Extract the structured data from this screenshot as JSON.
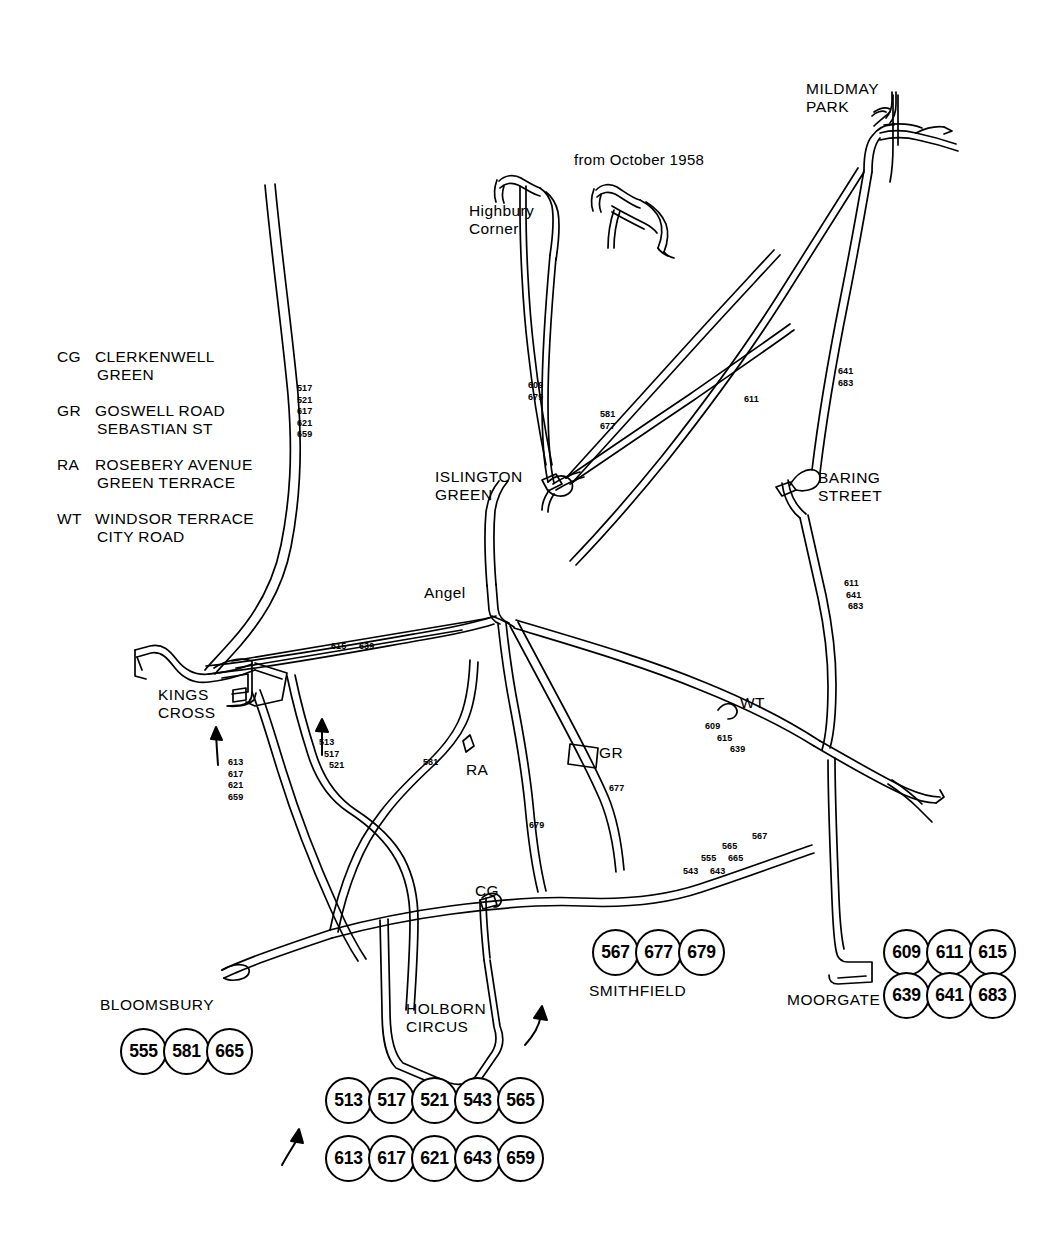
{
  "diagram": {
    "note": "from October 1958"
  },
  "legend": {
    "items": [
      {
        "code": "CG",
        "lines": [
          "CLERKENWELL",
          "GREEN"
        ]
      },
      {
        "code": "GR",
        "lines": [
          "GOSWELL ROAD",
          "SEBASTIAN ST"
        ]
      },
      {
        "code": "RA",
        "lines": [
          "ROSEBERY AVENUE",
          "GREEN TERRACE"
        ]
      },
      {
        "code": "WT",
        "lines": [
          "WINDSOR TERRACE",
          "CITY ROAD"
        ]
      }
    ]
  },
  "places": {
    "mildmay_park": "MILDMAY\nPARK",
    "mildmay_park_l1": "MILDMAY",
    "mildmay_park_l2": "PARK",
    "highbury_corner_l1": "Highbury",
    "highbury_corner_l2": "Corner",
    "islington_green_l1": "ISLINGTON",
    "islington_green_l2": "GREEN",
    "baring_street_l1": "BARING",
    "baring_street_l2": "STREET",
    "angel": "Angel",
    "kings_cross_l1": "KINGS",
    "kings_cross_l2": "CROSS",
    "holborn_circus_l1": "HOLBORN",
    "holborn_circus_l2": "CIRCUS",
    "bloomsbury": "BLOOMSBURY",
    "smithfield": "SMITHFIELD",
    "moorgate": "MOORGATE"
  },
  "markers": {
    "cg": "CG",
    "gr": "GR",
    "ra": "RA",
    "wt": "WT"
  },
  "route_labels": [
    {
      "id": "top-left-trunk",
      "numbers": [
        "517",
        "521",
        "617",
        "621",
        "659"
      ]
    },
    {
      "id": "highbury-branch",
      "numbers": [
        "609",
        "679"
      ]
    },
    {
      "id": "islington-diagonal",
      "numbers": [
        "581",
        "677"
      ]
    },
    {
      "id": "mildmay-cross",
      "numbers": [
        "611"
      ]
    },
    {
      "id": "mildmay-down",
      "numbers": [
        "641",
        "683"
      ]
    },
    {
      "id": "baring-south",
      "numbers": [
        "611",
        "641",
        "683"
      ]
    },
    {
      "id": "angel-west",
      "numbers": [
        "615",
        "639"
      ]
    },
    {
      "id": "kings-cross-south",
      "numbers": [
        "613",
        "617",
        "621",
        "659"
      ]
    },
    {
      "id": "pentonville-south",
      "numbers": [
        "513",
        "517",
        "521"
      ]
    },
    {
      "id": "rosebery",
      "numbers": [
        "581"
      ]
    },
    {
      "id": "goswell",
      "numbers": [
        "677"
      ]
    },
    {
      "id": "st-johns",
      "numbers": [
        "679"
      ]
    },
    {
      "id": "windsor-terrace",
      "numbers": [
        "609",
        "615",
        "639"
      ]
    },
    {
      "id": "city-east-1",
      "numbers": [
        "543",
        "643"
      ]
    },
    {
      "id": "city-east-2",
      "numbers": [
        "555",
        "665"
      ]
    },
    {
      "id": "city-east-3",
      "numbers": [
        "565"
      ]
    },
    {
      "id": "city-east-4",
      "numbers": [
        "567"
      ]
    }
  ],
  "route_groups": [
    {
      "id": "bloomsbury",
      "label": "BLOOMSBURY",
      "rows": [
        [
          "555",
          "581",
          "665"
        ]
      ]
    },
    {
      "id": "holborn-circus",
      "label": "",
      "rows": [
        [
          "513",
          "517",
          "521",
          "543",
          "565"
        ],
        [
          "613",
          "617",
          "621",
          "643",
          "659"
        ]
      ]
    },
    {
      "id": "smithfield",
      "label": "SMITHFIELD",
      "rows": [
        [
          "567",
          "677",
          "679"
        ]
      ]
    },
    {
      "id": "moorgate",
      "label": "MOORGATE",
      "rows": [
        [
          "609",
          "611",
          "615"
        ],
        [
          "639",
          "641",
          "683"
        ]
      ]
    }
  ],
  "colors": {
    "ink": "#000000",
    "paper": "#ffffff"
  }
}
